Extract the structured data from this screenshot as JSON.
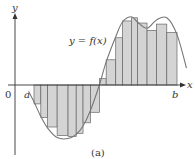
{
  "figure": {
    "caption": "(a)",
    "curve_label": "y = f(x)",
    "axis_x_label": "x",
    "axis_y_label": "y",
    "origin_label": "0",
    "a_label": "a",
    "b_label": "b",
    "colors": {
      "rect_fill": "#d4d4d4",
      "rect_stroke": "#666666",
      "curve": "#777777",
      "axis": "#333333"
    }
  },
  "chart_data": {
    "type": "area",
    "partition_x": [
      0.0,
      0.5,
      1.0,
      1.7,
      2.5,
      3.1,
      3.6,
      4.15,
      4.8,
      5.3,
      6.0,
      6.5,
      7.15,
      7.6,
      8.3,
      9.0,
      9.75,
      10.5
    ],
    "rect_heights": [
      -0.9,
      -1.55,
      -2.0,
      -2.4,
      -2.45,
      -2.3,
      -1.8,
      -1.3,
      0.3,
      1.2,
      2.25,
      3.05,
      3.2,
      2.95,
      2.6,
      2.9,
      2.5
    ],
    "curve_x": [
      -0.4,
      0.0,
      0.5,
      1.0,
      1.7,
      2.5,
      3.1,
      3.6,
      4.15,
      4.8,
      5.3,
      6.0,
      6.5,
      7.15,
      7.6,
      8.3,
      9.0,
      9.75,
      10.5,
      11.2
    ],
    "curve_y": [
      -0.3,
      -0.8,
      -1.5,
      -2.05,
      -2.5,
      -2.55,
      -2.35,
      -1.95,
      -1.2,
      0.0,
      1.1,
      2.3,
      3.0,
      3.25,
      3.0,
      2.7,
      3.1,
      3.2,
      2.4,
      0.8
    ],
    "xlim": [
      -1.2,
      11.8
    ],
    "ylim": [
      -3.2,
      4.0
    ]
  }
}
